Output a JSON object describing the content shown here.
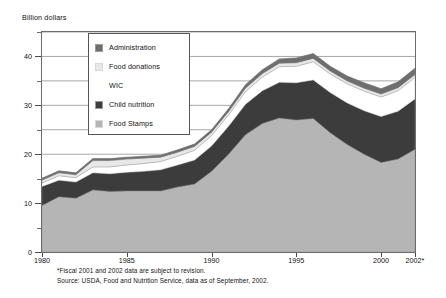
{
  "axis_title": "Billion dollars",
  "legend": {
    "items": [
      {
        "label": "Administration",
        "color": "#6e6e6e",
        "swatch": "filled"
      },
      {
        "label": "Food donations",
        "color": "#e8e8e8",
        "swatch": "light"
      },
      {
        "label": "WIC",
        "color": "#ffffff",
        "swatch": "none"
      },
      {
        "label": "Child nutrition",
        "color": "#3c3c3c",
        "swatch": "filled"
      },
      {
        "label": "Food Stamps",
        "color": "#b5b5b5",
        "swatch": "light"
      }
    ]
  },
  "footnotes": [
    "*Fiscal 2001 and 2002 data are subject to revision.",
    "Source: USDA, Food and Nutrition Service, data as of September, 2002."
  ],
  "chart_data": {
    "type": "area",
    "stacked": true,
    "title": "",
    "xlabel": "",
    "ylabel": "Billion dollars",
    "xlim": [
      1980,
      2002
    ],
    "ylim": [
      0,
      45
    ],
    "grid": true,
    "legend_position": "inside-upper-left",
    "x": [
      1980,
      1981,
      1982,
      1983,
      1984,
      1985,
      1986,
      1987,
      1988,
      1989,
      1990,
      1991,
      1992,
      1993,
      1994,
      1995,
      1996,
      1997,
      1998,
      1999,
      2000,
      2001,
      2002
    ],
    "xticks": [
      1980,
      1985,
      1990,
      1995,
      2000,
      2002
    ],
    "xticklabels": [
      "1980",
      "1985",
      "1990",
      "1995",
      "2000",
      "2002*"
    ],
    "yticks": [
      0,
      10,
      20,
      30,
      40
    ],
    "yticks_minor": [
      5,
      15,
      25,
      35,
      45
    ],
    "series": [
      {
        "name": "Food Stamps",
        "color": "#b5b5b5",
        "values": [
          9.5,
          11.3,
          11.0,
          12.7,
          12.4,
          12.5,
          12.5,
          12.5,
          13.3,
          13.9,
          16.5,
          20.0,
          24.0,
          26.3,
          27.4,
          27.0,
          27.3,
          24.4,
          22.0,
          20.0,
          18.3,
          19.0,
          21.0
        ]
      },
      {
        "name": "Child nutrition",
        "color": "#3c3c3c",
        "values": [
          3.9,
          3.4,
          3.3,
          3.5,
          3.6,
          3.8,
          4.0,
          4.3,
          4.5,
          4.9,
          5.2,
          5.7,
          6.2,
          6.7,
          7.3,
          7.6,
          7.9,
          8.2,
          8.5,
          8.9,
          9.4,
          9.8,
          10.3
        ]
      },
      {
        "name": "WIC",
        "color": "#ffffff",
        "values": [
          0.7,
          0.9,
          0.9,
          1.2,
          1.4,
          1.5,
          1.6,
          1.7,
          1.8,
          2.0,
          2.1,
          2.3,
          2.6,
          2.8,
          3.2,
          3.4,
          3.7,
          3.8,
          3.9,
          4.0,
          4.0,
          4.2,
          4.4
        ]
      },
      {
        "name": "Food donations",
        "color": "#e8e8e8",
        "values": [
          0.6,
          0.6,
          0.6,
          1.3,
          1.3,
          1.2,
          1.1,
          0.9,
          0.8,
          0.8,
          0.7,
          0.7,
          0.7,
          0.7,
          0.7,
          0.7,
          0.7,
          0.6,
          0.6,
          0.6,
          0.6,
          0.6,
          0.6
        ]
      },
      {
        "name": "Administration",
        "color": "#6e6e6e",
        "values": [
          0.4,
          0.4,
          0.4,
          0.4,
          0.4,
          0.4,
          0.4,
          0.4,
          0.5,
          0.5,
          0.5,
          0.6,
          0.7,
          0.8,
          0.9,
          1.0,
          1.0,
          1.0,
          1.0,
          1.1,
          1.1,
          1.2,
          1.3
        ]
      }
    ]
  }
}
